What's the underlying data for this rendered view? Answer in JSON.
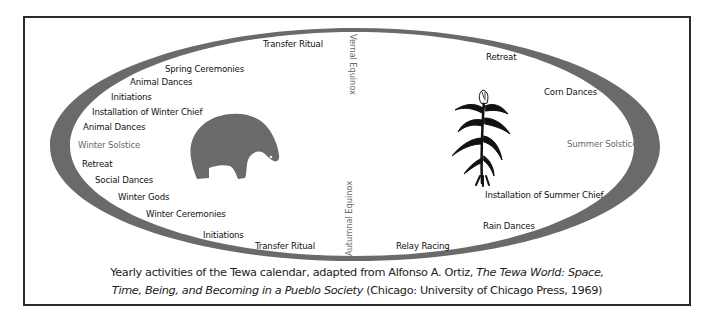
{
  "diagram": {
    "title": "Tewa calendar",
    "colors": {
      "ring": "#6a6a6a",
      "bear": "#6a6a6a",
      "corn": "#111111",
      "frame": "#2b2b2b",
      "activity_text": "#111111",
      "season_text": "#6b6b6b"
    },
    "axes": {
      "vernal_equinox": "Vernal Equinox",
      "autumnal_equinox": "Autumnal Equinox",
      "winter_solstice": "Winter Solstice",
      "summer_solstice": "Summer Solstice"
    },
    "winter_half": {
      "symbol": "bear-icon",
      "activities": [
        {
          "label": "Transfer Ritual"
        },
        {
          "label": "Spring Ceremonies"
        },
        {
          "label": "Animal Dances"
        },
        {
          "label": "Initiations"
        },
        {
          "label": "Installation of Winter Chief"
        },
        {
          "label": "Animal Dances"
        },
        {
          "label": "Retreat"
        },
        {
          "label": "Social Dances"
        },
        {
          "label": "Winter Gods"
        },
        {
          "label": "Winter Ceremonies"
        },
        {
          "label": "Initiations"
        },
        {
          "label": "Transfer Ritual"
        }
      ]
    },
    "summer_half": {
      "symbol": "corn-plant-icon",
      "activities": [
        {
          "label": "Retreat"
        },
        {
          "label": "Corn Dances"
        },
        {
          "label": "Installation of Summer Chief"
        },
        {
          "label": "Rain Dances"
        },
        {
          "label": "Relay Racing"
        }
      ]
    }
  },
  "caption": {
    "line1_plain": "Yearly activities of the Tewa calendar, adapted from Alfonso A.  Ortiz, ",
    "line1_italic": "The Tewa World: Space,",
    "line2_italic": "Time, Being, and Becoming in a  Pueblo Society",
    "line2_plain": " (Chicago: University of Chicago Press, 1969)"
  }
}
